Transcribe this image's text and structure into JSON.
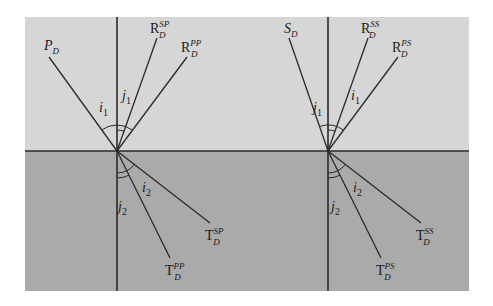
{
  "figure": {
    "width": 493,
    "height": 306,
    "colors": {
      "background": "#ffffff",
      "upper_medium": "#d6d6d6",
      "lower_medium": "#aaaaaa",
      "lines": "#2a2a2a"
    },
    "panel": {
      "x": 25,
      "y": 17,
      "w": 444,
      "h": 274,
      "interface_y": 151
    }
  },
  "left_panel": {
    "origin": [
      117,
      151
    ],
    "incident": {
      "base": "P",
      "sub": "D",
      "sup": "",
      "end": [
        49,
        57
      ],
      "label_pos": [
        44,
        50
      ]
    },
    "reflected_sv": {
      "base": "R",
      "sub": "D",
      "sup": "SP",
      "end": [
        157,
        38
      ],
      "label_pos": [
        150,
        33
      ]
    },
    "reflected_p": {
      "base": "R",
      "sub": "D",
      "sup": "PP",
      "end": [
        187,
        57
      ],
      "label_pos": [
        181,
        52
      ]
    },
    "transmitted_sv": {
      "base": "T",
      "sub": "D",
      "sup": "SP",
      "end": [
        210,
        223
      ],
      "label_pos": [
        205,
        240
      ]
    },
    "transmitted_p": {
      "base": "T",
      "sub": "D",
      "sup": "PP",
      "end": [
        170,
        258
      ],
      "label_pos": [
        165,
        275
      ]
    },
    "angles": {
      "i1": {
        "base": "i",
        "sub": "1",
        "pos": [
          99,
          112
        ]
      },
      "j1": {
        "base": "j",
        "sub": "1",
        "pos": [
          122,
          100
        ]
      },
      "i2": {
        "base": "i",
        "sub": "2",
        "pos": [
          142,
          192
        ]
      },
      "j2": {
        "base": "j",
        "sub": "2",
        "pos": [
          118,
          211
        ]
      }
    }
  },
  "right_panel": {
    "origin": [
      328,
      151
    ],
    "incident": {
      "base": "S",
      "sub": "D",
      "sup": "",
      "end": [
        289,
        38
      ],
      "label_pos": [
        284,
        33
      ]
    },
    "reflected_sv": {
      "base": "R",
      "sub": "D",
      "sup": "SS",
      "end": [
        368,
        38
      ],
      "label_pos": [
        361,
        33
      ]
    },
    "reflected_p": {
      "base": "R",
      "sub": "D",
      "sup": "PS",
      "end": [
        398,
        57
      ],
      "label_pos": [
        392,
        52
      ]
    },
    "transmitted_sv": {
      "base": "T",
      "sub": "D",
      "sup": "SS",
      "end": [
        421,
        223
      ],
      "label_pos": [
        416,
        240
      ]
    },
    "transmitted_p": {
      "base": "T",
      "sub": "D",
      "sup": "PS",
      "end": [
        381,
        258
      ],
      "label_pos": [
        376,
        275
      ]
    },
    "angles": {
      "j1": {
        "base": "j",
        "sub": "1",
        "pos": [
          313,
          112
        ]
      },
      "i1": {
        "base": "i",
        "sub": "1",
        "pos": [
          351,
          100
        ]
      },
      "i2": {
        "base": "i",
        "sub": "2",
        "pos": [
          353,
          192
        ]
      },
      "j2": {
        "base": "j",
        "sub": "2",
        "pos": [
          331,
          211
        ]
      }
    }
  }
}
